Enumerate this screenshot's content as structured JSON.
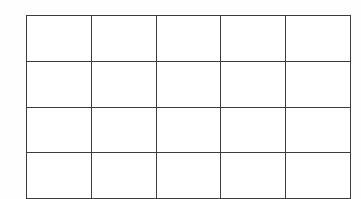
{
  "figure": {
    "kind": "empty-grid-table",
    "title": "",
    "caption": "",
    "background_color": "#ffffff",
    "line_color": "#3c3c3c",
    "cell_fill_color": "#ffffff",
    "border_width_px": 1.6
  },
  "grid": {
    "columns": 5,
    "rows": 4,
    "total_cells": 20,
    "outer_left_px": 26,
    "outer_top_px": 15,
    "outer_right_px": 345,
    "outer_bottom_px": 194,
    "outer_width_px": 319,
    "outer_height_px": 179,
    "column_x_positions_px": [
      26,
      90,
      153,
      217,
      281,
      345
    ],
    "row_y_positions_px": [
      15,
      60,
      105,
      150,
      194
    ],
    "column_width_px": 63.8,
    "row_height_px": 44.75
  },
  "column_headers": [
    "",
    "",
    "",
    "",
    ""
  ],
  "rows": [
    {
      "name": "row-1",
      "cells": [
        "",
        "",
        "",
        "",
        ""
      ]
    },
    {
      "name": "row-2",
      "cells": [
        "",
        "",
        "",
        "",
        ""
      ]
    },
    {
      "name": "row-3",
      "cells": [
        "",
        "",
        "",
        "",
        ""
      ]
    },
    {
      "name": "row-4",
      "cells": [
        "",
        "",
        "",
        "",
        ""
      ]
    }
  ]
}
